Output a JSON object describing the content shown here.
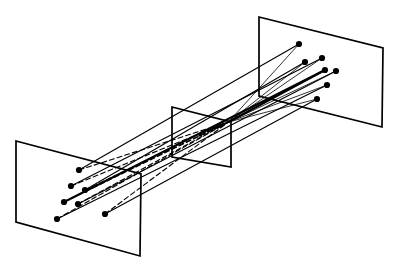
{
  "figure": {
    "background_color": "#ffffff",
    "stroke_color": "#000000",
    "point_color": "#000000",
    "width": 394,
    "height": 268
  },
  "style": {
    "plane_stroke_width": 1.7,
    "ray_solid_stroke_width": 1.15,
    "ray_thick_stroke_width": 2.0,
    "ray_thin_stroke_width": 0.8,
    "ray_dashed_stroke_width": 1.1,
    "dash_pattern": "5,3",
    "point_radius": 3.1,
    "mid_point_radius": 1.7
  },
  "planes": [
    {
      "name": "left-plane",
      "label": "left image plane",
      "points": "16,141 141,174 140,256 16,222"
    },
    {
      "name": "middle-plane",
      "label": "middle image plane",
      "points": "172,107 231,122 231,167 172,157"
    },
    {
      "name": "right-plane",
      "label": "right image plane",
      "points": "259,17 383,48 382,127 259,96"
    }
  ],
  "convergence": {
    "x": 228.5,
    "y": 122.0
  },
  "left_points": [
    {
      "x": 79,
      "y": 170
    },
    {
      "x": 71,
      "y": 186
    },
    {
      "x": 85,
      "y": 190
    },
    {
      "x": 64,
      "y": 202
    },
    {
      "x": 78,
      "y": 204
    },
    {
      "x": 57,
      "y": 219
    },
    {
      "x": 105,
      "y": 214
    }
  ],
  "right_points": [
    {
      "x": 299,
      "y": 44
    },
    {
      "x": 322,
      "y": 58
    },
    {
      "x": 305,
      "y": 62
    },
    {
      "x": 325,
      "y": 70
    },
    {
      "x": 336,
      "y": 71
    },
    {
      "x": 327,
      "y": 85
    },
    {
      "x": 317,
      "y": 99
    }
  ],
  "mid_points": [
    {
      "x": 200,
      "y": 135
    },
    {
      "x": 204,
      "y": 133
    },
    {
      "x": 208,
      "y": 131
    },
    {
      "x": 211,
      "y": 130
    },
    {
      "x": 214,
      "y": 128
    },
    {
      "x": 217,
      "y": 127
    },
    {
      "x": 220,
      "y": 126
    },
    {
      "x": 223,
      "y": 124
    }
  ],
  "left_rays": [
    {
      "name": "ray-left-1",
      "from": {
        "x": 79,
        "y": 170
      },
      "to": {
        "x": 228.5,
        "y": 122
      },
      "dashed": true,
      "weight": "thin"
    },
    {
      "name": "ray-left-2",
      "from": {
        "x": 71,
        "y": 186
      },
      "to": {
        "x": 228.5,
        "y": 122
      },
      "dashed": true,
      "weight": "thin"
    },
    {
      "name": "ray-left-3",
      "from": {
        "x": 85,
        "y": 190
      },
      "to": {
        "x": 228.5,
        "y": 122
      },
      "dashed": true,
      "weight": "thin"
    },
    {
      "name": "ray-left-4",
      "from": {
        "x": 64,
        "y": 202
      },
      "to": {
        "x": 228.5,
        "y": 122
      },
      "dashed": true,
      "weight": "thin"
    },
    {
      "name": "ray-left-5",
      "from": {
        "x": 78,
        "y": 204
      },
      "to": {
        "x": 228.5,
        "y": 122
      },
      "dashed": true,
      "weight": "thin"
    },
    {
      "name": "ray-left-6",
      "from": {
        "x": 57,
        "y": 219
      },
      "to": {
        "x": 228.5,
        "y": 122
      },
      "dashed": true,
      "weight": "thin"
    },
    {
      "name": "ray-left-7",
      "from": {
        "x": 105,
        "y": 214
      },
      "to": {
        "x": 228.5,
        "y": 122
      },
      "dashed": true,
      "weight": "thin"
    }
  ],
  "right_rays": [
    {
      "name": "ray-right-1",
      "from": {
        "x": 299,
        "y": 44
      },
      "to": {
        "x": 228.5,
        "y": 122
      },
      "dashed": false,
      "weight": "thin"
    },
    {
      "name": "ray-right-2",
      "from": {
        "x": 322,
        "y": 58
      },
      "to": {
        "x": 228.5,
        "y": 122
      },
      "dashed": false,
      "weight": "thin"
    },
    {
      "name": "ray-right-3",
      "from": {
        "x": 305,
        "y": 62
      },
      "to": {
        "x": 228.5,
        "y": 122
      },
      "dashed": false,
      "weight": "thin"
    },
    {
      "name": "ray-right-4",
      "from": {
        "x": 325,
        "y": 70
      },
      "to": {
        "x": 228.5,
        "y": 122
      },
      "dashed": false,
      "weight": "thick"
    },
    {
      "name": "ray-right-5",
      "from": {
        "x": 336,
        "y": 71
      },
      "to": {
        "x": 228.5,
        "y": 122
      },
      "dashed": false,
      "weight": "thin"
    },
    {
      "name": "ray-right-6",
      "from": {
        "x": 327,
        "y": 85
      },
      "to": {
        "x": 228.5,
        "y": 122
      },
      "dashed": false,
      "weight": "thin"
    },
    {
      "name": "ray-right-7",
      "from": {
        "x": 317,
        "y": 99
      },
      "to": {
        "x": 228.5,
        "y": 122
      },
      "dashed": false,
      "weight": "thin"
    }
  ],
  "through_rays": [
    {
      "name": "through-ray-1",
      "from": {
        "x": 79,
        "y": 170
      },
      "to": {
        "x": 299,
        "y": 44
      },
      "weight": "solid"
    },
    {
      "name": "through-ray-2",
      "from": {
        "x": 71,
        "y": 186
      },
      "to": {
        "x": 322,
        "y": 58
      },
      "weight": "solid"
    },
    {
      "name": "through-ray-3",
      "from": {
        "x": 85,
        "y": 190
      },
      "to": {
        "x": 305,
        "y": 62
      },
      "weight": "solid"
    },
    {
      "name": "through-ray-4",
      "from": {
        "x": 64,
        "y": 202
      },
      "to": {
        "x": 325,
        "y": 70
      },
      "weight": "thick"
    },
    {
      "name": "through-ray-5",
      "from": {
        "x": 78,
        "y": 204
      },
      "to": {
        "x": 336,
        "y": 71
      },
      "weight": "solid"
    },
    {
      "name": "through-ray-6",
      "from": {
        "x": 57,
        "y": 219
      },
      "to": {
        "x": 327,
        "y": 85
      },
      "weight": "solid"
    },
    {
      "name": "through-ray-7",
      "from": {
        "x": 105,
        "y": 214
      },
      "to": {
        "x": 317,
        "y": 99
      },
      "weight": "solid"
    }
  ]
}
